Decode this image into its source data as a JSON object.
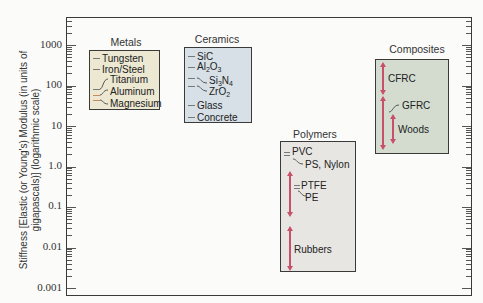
{
  "chart_data": {
    "type": "range",
    "title": "",
    "xlabel": "",
    "ylabel": "Stiffness [Elastic (or Young's) Modulus (in units of gigapascals)] (logarithmic scale)",
    "yscale": "log",
    "ylim": [
      0.001,
      3000
    ],
    "yticks": [
      "1000",
      "100",
      "10",
      "1.0",
      "0.1",
      "0.01",
      "0.001"
    ],
    "grid": false,
    "groups": [
      {
        "name": "Metals",
        "color": "#ece8d2",
        "range": [
          25,
          1000
        ],
        "materials": [
          {
            "name": "Tungsten",
            "value": 407
          },
          {
            "name": "Iron/Steel",
            "value": 207
          },
          {
            "name": "Titanium",
            "value": 107
          },
          {
            "name": "Aluminum",
            "value": 69
          },
          {
            "name": "Magnesium",
            "value": 45
          }
        ]
      },
      {
        "name": "Ceramics",
        "color": "#d6e0e6",
        "range": [
          15,
          1000
        ],
        "materials": [
          {
            "name": "SiC",
            "value": 450
          },
          {
            "name": "Al2O3",
            "value": 380
          },
          {
            "name": "Si3N4",
            "value": 304
          },
          {
            "name": "ZrO2",
            "value": 205
          },
          {
            "name": "Glass",
            "value": 70
          },
          {
            "name": "Concrete",
            "value": 30
          }
        ]
      },
      {
        "name": "Polymers",
        "color": "#e8e6e2",
        "range": [
          0.001,
          5
        ],
        "materials": [
          {
            "name": "PVC",
            "value": 3.4
          },
          {
            "name": "PS, Nylon",
            "value": 2.5
          },
          {
            "name": "PTFE",
            "value": 0.5
          },
          {
            "name": "PE",
            "value": 0.2
          },
          {
            "name": "Rubbers",
            "value": [
              0.001,
              0.1
            ]
          }
        ]
      },
      {
        "name": "Composites",
        "color": "#d3dccf",
        "range": [
          2,
          500
        ],
        "materials": [
          {
            "name": "CFRC",
            "value": [
              70,
              400
            ]
          },
          {
            "name": "GFRC",
            "value": [
              7,
              50
            ]
          },
          {
            "name": "Woods",
            "value": [
              4,
              20
            ]
          }
        ]
      }
    ]
  },
  "axis": {
    "ylabel_line1": "Stiffness [Elastic (or Young's) Modulus (in units of",
    "ylabel_line2": "gigapascals)] (logarithmic scale)",
    "ticks": [
      "1000",
      "100",
      "10",
      "1.0",
      "0.1",
      "0.01",
      "0.001"
    ]
  },
  "groups": {
    "metals": {
      "title": "Metals",
      "items": [
        "Tungsten",
        "Iron/Steel",
        "Titanium",
        "Aluminum",
        "Magnesium"
      ]
    },
    "ceramics": {
      "title": "Ceramics",
      "items": [
        "SiC",
        "Al",
        "2",
        "O",
        "3",
        "Si",
        "3",
        "N",
        "4",
        "Zr",
        "O",
        "2",
        "Glass",
        "Concrete"
      ]
    },
    "polymers": {
      "title": "Polymers",
      "items": [
        "PVC",
        "PS, Nylon",
        "PTFE",
        "PE",
        "Rubbers"
      ]
    },
    "composites": {
      "title": "Composites",
      "items": [
        "CFRC",
        "GFRC",
        "Woods"
      ]
    }
  },
  "colors": {
    "metals_bg": "#ece8d2",
    "ceramics_bg": "#d6e0e6",
    "polymers_bg": "#e8e6e2",
    "composites_bg": "#d3dccf",
    "arrow": "#c9506a"
  }
}
